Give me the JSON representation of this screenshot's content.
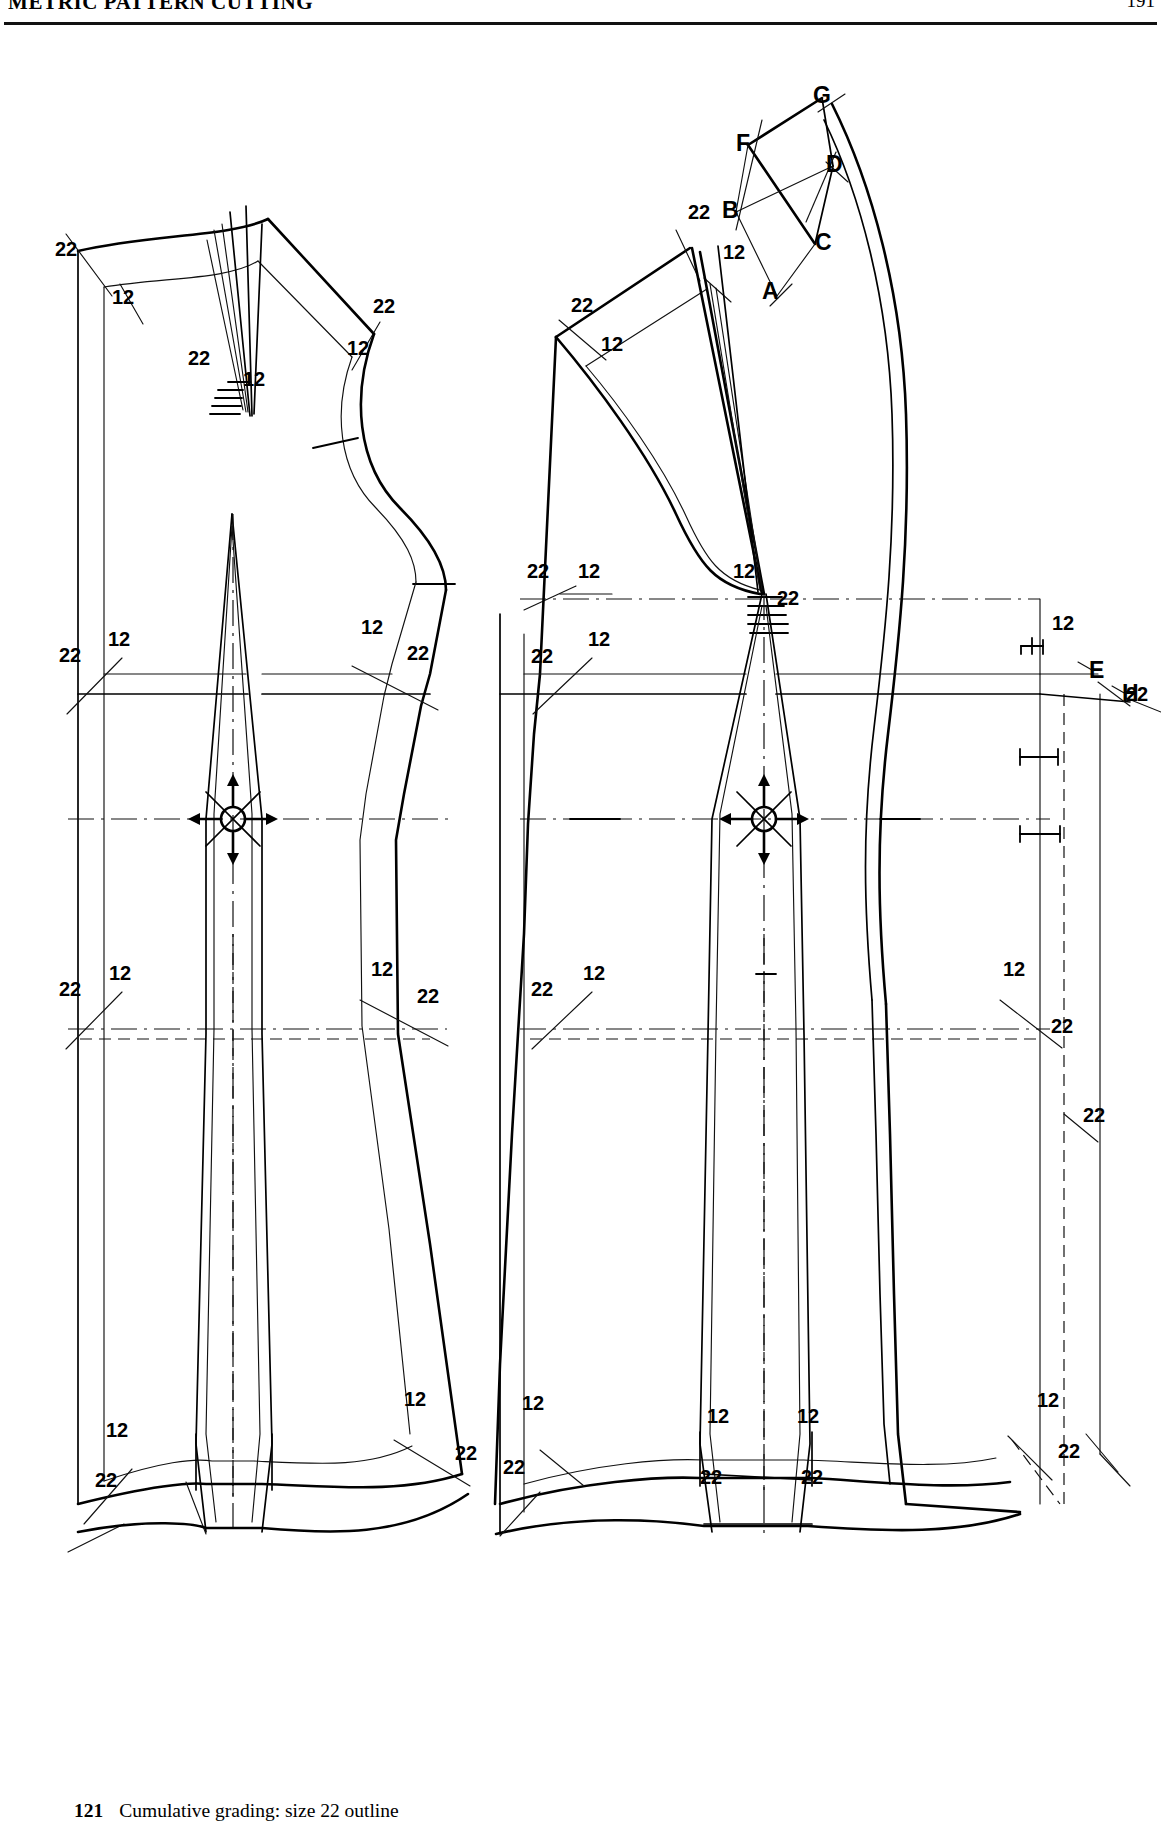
{
  "runhead": {
    "title": "METRIC PATTERN CUTTING",
    "folio": "191"
  },
  "caption": {
    "number": "121",
    "text": "Cumulative grading: size 22 outline"
  },
  "legend": {
    "small_size": "12",
    "large_size": "22"
  },
  "pieces": [
    {
      "name": "back-bodice-block",
      "side": "left"
    },
    {
      "name": "front-bodice-block",
      "side": "right"
    }
  ],
  "construction_points": [
    {
      "id": "A",
      "x": 772,
      "y": 258
    },
    {
      "id": "B",
      "x": 734,
      "y": 177
    },
    {
      "id": "C",
      "x": 821,
      "y": 209
    },
    {
      "id": "D",
      "x": 833,
      "y": 131
    },
    {
      "id": "E",
      "x": 1097,
      "y": 637
    },
    {
      "id": "F",
      "x": 747,
      "y": 111
    },
    {
      "id": "G",
      "x": 821,
      "y": 64
    },
    {
      "id": "H",
      "x": 1130,
      "y": 660
    }
  ],
  "size_labels": [
    {
      "text": "22",
      "x": 55,
      "y": 239
    },
    {
      "text": "12",
      "x": 112,
      "y": 287
    },
    {
      "text": "22",
      "x": 188,
      "y": 348
    },
    {
      "text": "12",
      "x": 243,
      "y": 369
    },
    {
      "text": "22",
      "x": 373,
      "y": 296
    },
    {
      "text": "12",
      "x": 347,
      "y": 338
    },
    {
      "text": "12",
      "x": 361,
      "y": 617
    },
    {
      "text": "22",
      "x": 407,
      "y": 643
    },
    {
      "text": "22",
      "x": 59,
      "y": 645
    },
    {
      "text": "12",
      "x": 108,
      "y": 629
    },
    {
      "text": "22",
      "x": 59,
      "y": 979
    },
    {
      "text": "12",
      "x": 109,
      "y": 963
    },
    {
      "text": "12",
      "x": 371,
      "y": 959
    },
    {
      "text": "22",
      "x": 417,
      "y": 986
    },
    {
      "text": "12",
      "x": 106,
      "y": 1420
    },
    {
      "text": "22",
      "x": 95,
      "y": 1470
    },
    {
      "text": "12",
      "x": 404,
      "y": 1389
    },
    {
      "text": "22",
      "x": 455,
      "y": 1443
    },
    {
      "text": "22",
      "x": 688,
      "y": 202
    },
    {
      "text": "12",
      "x": 723,
      "y": 242
    },
    {
      "text": "22",
      "x": 571,
      "y": 295
    },
    {
      "text": "12",
      "x": 601,
      "y": 334
    },
    {
      "text": "22",
      "x": 527,
      "y": 561
    },
    {
      "text": "12",
      "x": 578,
      "y": 561
    },
    {
      "text": "12",
      "x": 733,
      "y": 561
    },
    {
      "text": "22",
      "x": 777,
      "y": 588
    },
    {
      "text": "22",
      "x": 531,
      "y": 646
    },
    {
      "text": "12",
      "x": 588,
      "y": 629
    },
    {
      "text": "12",
      "x": 1052,
      "y": 613
    },
    {
      "text": "22",
      "x": 1126,
      "y": 684
    },
    {
      "text": "22",
      "x": 531,
      "y": 979
    },
    {
      "text": "12",
      "x": 583,
      "y": 963
    },
    {
      "text": "12",
      "x": 1003,
      "y": 959
    },
    {
      "text": "22",
      "x": 1051,
      "y": 1016
    },
    {
      "text": "22",
      "x": 1083,
      "y": 1105
    },
    {
      "text": "12",
      "x": 522,
      "y": 1393
    },
    {
      "text": "22",
      "x": 503,
      "y": 1457
    },
    {
      "text": "12",
      "x": 707,
      "y": 1406
    },
    {
      "text": "12",
      "x": 797,
      "y": 1406
    },
    {
      "text": "22",
      "x": 700,
      "y": 1467
    },
    {
      "text": "22",
      "x": 801,
      "y": 1467
    },
    {
      "text": "12",
      "x": 1037,
      "y": 1390
    },
    {
      "text": "22",
      "x": 1058,
      "y": 1441
    }
  ],
  "colors": {
    "ink": "#000000",
    "paper": "#ffffff",
    "thin": "#111111"
  }
}
